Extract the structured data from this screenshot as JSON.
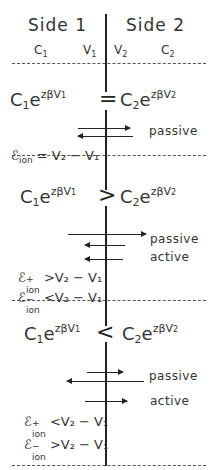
{
  "header": {
    "side1": "Side 1",
    "side2": "Side 2",
    "labels": {
      "c1": "C",
      "c1_sub": "1",
      "v1": "V",
      "v1_sub": "1",
      "v2": "V",
      "v2_sub": "2",
      "c2": "C",
      "c2_sub": "2"
    }
  },
  "sections": [
    {
      "left": {
        "c": "C",
        "c_sub": "1",
        "e": "e",
        "exp": "zβV",
        "exp_sub": "1"
      },
      "relation": "=",
      "right": {
        "c": "C",
        "c_sub": "2",
        "e": "e",
        "exp": "zβV",
        "exp_sub": "2"
      },
      "flux_labels": [
        "passive"
      ],
      "conditions": [
        {
          "sym": "ℰ",
          "sub": "ion",
          "sup": "",
          "rel": "=",
          "rhs": "V₂ − V₁"
        }
      ]
    },
    {
      "left": {
        "c": "C",
        "c_sub": "1",
        "e": "e",
        "exp": "zβV",
        "exp_sub": "1"
      },
      "relation": ">",
      "right": {
        "c": "C",
        "c_sub": "2",
        "e": "e",
        "exp": "zβV",
        "exp_sub": "2"
      },
      "flux_labels": [
        "passive",
        "active"
      ],
      "conditions": [
        {
          "sym": "ℰ",
          "sub": "ion",
          "sup": "+",
          "rel": ">",
          "rhs": "V₂ − V₁"
        },
        {
          "sym": "ℰ",
          "sub": "ion",
          "sup": "−",
          "rel": "<",
          "rhs": "V₂ − V₁"
        }
      ]
    },
    {
      "left": {
        "c": "C",
        "c_sub": "1",
        "e": "e",
        "exp": "zβV",
        "exp_sub": "1"
      },
      "relation": "<",
      "right": {
        "c": "C",
        "c_sub": "2",
        "e": "e",
        "exp": "zβV",
        "exp_sub": "2"
      },
      "flux_labels": [
        "passive",
        "active"
      ],
      "conditions": [
        {
          "sym": "ℰ",
          "sub": "ion",
          "sup": "+",
          "rel": "<",
          "rhs": "V₂ − V₁"
        },
        {
          "sym": "ℰ",
          "sub": "ion",
          "sup": "−",
          "rel": ">",
          "rhs": "V₂ − V₁"
        }
      ]
    }
  ],
  "colors": {
    "ink": "#222222",
    "background": "#ffffff"
  }
}
